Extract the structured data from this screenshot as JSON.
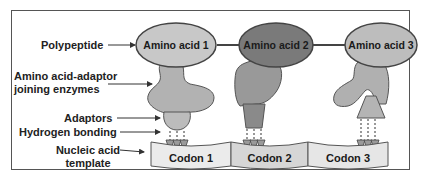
{
  "diagram": {
    "type": "protein-synthesis-schematic",
    "labels": {
      "polypeptide": "Polypeptide",
      "joining_enzymes_line1": "Amino acid-adaptor",
      "joining_enzymes_line2": "joining enzymes",
      "adaptors": "Adaptors",
      "hydrogen_bonding": "Hydrogen bonding",
      "template_line1": "Nucleic acid",
      "template_line2": "template"
    },
    "amino_acids": [
      {
        "label": "Amino acid 1",
        "color": "#c8c8c8"
      },
      {
        "label": "Amino acid 2",
        "color": "#7a7a7a"
      },
      {
        "label": "Amino acid 3",
        "color": "#bdbdbd"
      }
    ],
    "codons": [
      {
        "label": "Codon 1"
      },
      {
        "label": "Codon 2"
      },
      {
        "label": "Codon 3"
      }
    ],
    "colors": {
      "outline": "#444444",
      "enzyme": "#a8a8a8",
      "adaptor": "#bcbcbc",
      "template": "#e6e6e6"
    }
  }
}
